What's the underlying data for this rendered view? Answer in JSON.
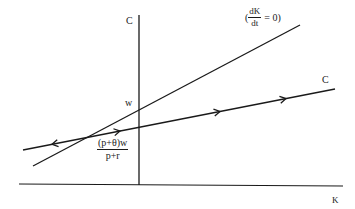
{
  "diagram": {
    "axes": {
      "y_label": "C",
      "x_label": "K"
    },
    "curves": [
      {
        "id": "dk-dt-zero",
        "label_open": "(",
        "label_num": "dK",
        "label_den": "dt",
        "label_close": "= 0)"
      },
      {
        "id": "c-path",
        "label": "C",
        "arrow_directions": [
          "left",
          "right",
          "right",
          "right"
        ]
      }
    ],
    "intercepts": {
      "w_label": "w",
      "fraction_num": "(p+θ)w",
      "fraction_den": "p+r"
    },
    "colors": {
      "line": "#1a1a1a",
      "background": "#ffffff"
    }
  }
}
